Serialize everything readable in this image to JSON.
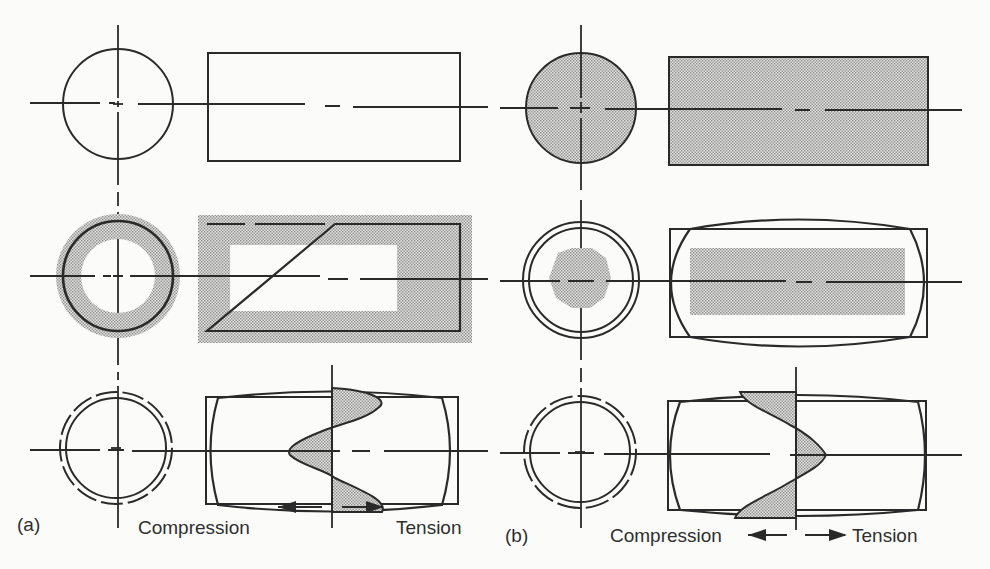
{
  "figure": {
    "panels": [
      {
        "id": "a",
        "label": "(a)",
        "legend": {
          "left": "Compression",
          "right": "Tension"
        },
        "rows": [
          {
            "state": "initial",
            "fill": "none"
          },
          {
            "state": "cooling-surface-shell",
            "fill": "surface-ring"
          },
          {
            "state": "final-residual-stress",
            "fill": "stress-profile",
            "profile": "surface-tension-core-compression"
          }
        ]
      },
      {
        "id": "b",
        "label": "(b)",
        "legend": {
          "left": "Compression",
          "right": "Tension"
        },
        "rows": [
          {
            "state": "initial",
            "fill": "full"
          },
          {
            "state": "cooling-core",
            "fill": "core"
          },
          {
            "state": "final-residual-stress",
            "fill": "stress-profile",
            "profile": "surface-compression-core-tension"
          }
        ]
      }
    ],
    "colors": {
      "line": "#2a2a2a",
      "stipple": "#9a9a9a",
      "background": "#fbfbfa"
    }
  }
}
